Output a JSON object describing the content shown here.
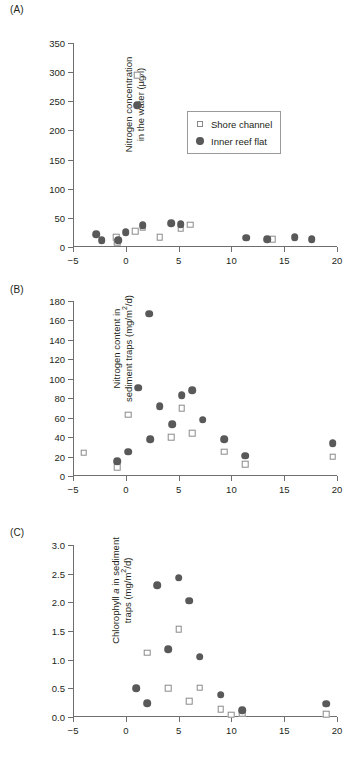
{
  "figure": {
    "panels": [
      {
        "id": "a",
        "label": "(A)",
        "ytitle_line1": "Nitrogen concentration",
        "ytitle_line2_pre": "in the water (µg/l)",
        "ytitle_line2_post": ""
      },
      {
        "id": "b",
        "label": "(B)",
        "ytitle_line1": "Nitrogen content in",
        "ytitle_line2_pre": "sediment traps (mg/m",
        "ytitle_line2_sup": "2",
        "ytitle_line2_post": "/d)"
      },
      {
        "id": "c",
        "label": "(C)",
        "ytitle_line1_pre": "Chlorophyll ",
        "ytitle_line1_em": "a",
        "ytitle_line1_post": " in sediment",
        "ytitle_line2_pre": "traps (mg/m",
        "ytitle_line2_sup": "2",
        "ytitle_line2_post": "/d)"
      }
    ],
    "legend": {
      "items": [
        {
          "label": "Shore channel",
          "marker": "open-square-icon",
          "color": "#8a8a8a"
        },
        {
          "label": "Inner reef flat",
          "marker": "filled-circle-icon",
          "color": "#595959"
        }
      ]
    },
    "colors": {
      "filled_marker": "#595959",
      "open_marker_edge": "#8a8a8a",
      "axis": "#6e6e6e",
      "text": "#231f20",
      "background": "#ffffff"
    }
  },
  "chart_data": [
    {
      "type": "scatter",
      "panel": "(A)",
      "title": "",
      "xlabel": "",
      "ylabel": "Nitrogen concentration in the water (µg/l)",
      "xlim": [
        -5,
        20
      ],
      "ylim": [
        0,
        350
      ],
      "xticks": [
        -5,
        0,
        5,
        10,
        15,
        20
      ],
      "yticks": [
        0,
        50,
        100,
        150,
        200,
        250,
        300,
        350
      ],
      "grid": false,
      "legend_position": "inside-upper-center",
      "series": [
        {
          "name": "Shore channel",
          "marker": "open square",
          "points": [
            [
              -0.9,
              17
            ],
            [
              -0.8,
              8
            ],
            [
              0.9,
              27
            ],
            [
              1.1,
              295
            ],
            [
              1.6,
              33
            ],
            [
              3.2,
              17
            ],
            [
              5.2,
              32
            ],
            [
              6.1,
              38
            ],
            [
              13.9,
              13
            ]
          ]
        },
        {
          "name": "Inner reef flat",
          "marker": "filled circle",
          "points": [
            [
              -2.8,
              22
            ],
            [
              -2.3,
              12
            ],
            [
              -0.7,
              12
            ],
            [
              0.0,
              25
            ],
            [
              1.1,
              243
            ],
            [
              1.6,
              37
            ],
            [
              4.3,
              41
            ],
            [
              5.2,
              39
            ],
            [
              11.4,
              16
            ],
            [
              13.4,
              13
            ],
            [
              16.0,
              17
            ],
            [
              17.6,
              13
            ]
          ]
        }
      ]
    },
    {
      "type": "scatter",
      "panel": "(B)",
      "title": "",
      "xlabel": "",
      "ylabel": "Nitrogen content in sediment traps (mg/m2/d)",
      "xlim": [
        -5,
        20
      ],
      "ylim": [
        0,
        180
      ],
      "xticks": [
        -5,
        0,
        5,
        10,
        15,
        20
      ],
      "yticks": [
        0,
        20,
        40,
        60,
        80,
        100,
        120,
        140,
        160,
        180
      ],
      "grid": false,
      "legend_position": "none",
      "series": [
        {
          "name": "Shore channel",
          "marker": "open square",
          "points": [
            [
              -4.0,
              24
            ],
            [
              -0.8,
              9
            ],
            [
              0.2,
              63
            ],
            [
              4.3,
              40
            ],
            [
              5.3,
              70
            ],
            [
              6.3,
              44
            ],
            [
              9.3,
              25
            ],
            [
              11.3,
              12
            ],
            [
              19.6,
              20
            ]
          ]
        },
        {
          "name": "Inner reef flat",
          "marker": "filled circle",
          "points": [
            [
              -0.8,
              15
            ],
            [
              0.2,
              25
            ],
            [
              1.2,
              91
            ],
            [
              2.2,
              167
            ],
            [
              2.3,
              38
            ],
            [
              3.2,
              72
            ],
            [
              4.4,
              53
            ],
            [
              5.3,
              83
            ],
            [
              6.3,
              88
            ],
            [
              7.3,
              58
            ],
            [
              9.3,
              38
            ],
            [
              11.3,
              21
            ],
            [
              19.6,
              34
            ]
          ]
        }
      ]
    },
    {
      "type": "scatter",
      "panel": "(C)",
      "title": "",
      "xlabel": "",
      "ylabel": "Chlorophyll a in sediment traps (mg/m2/d)",
      "xlim": [
        -5,
        20
      ],
      "ylim": [
        0.0,
        3.0
      ],
      "xticks": [
        -5,
        0,
        5,
        10,
        15,
        20
      ],
      "yticks": [
        0.0,
        0.5,
        1.0,
        1.5,
        2.0,
        2.5,
        3.0
      ],
      "grid": false,
      "legend_position": "none",
      "series": [
        {
          "name": "Shore channel",
          "marker": "open square",
          "points": [
            [
              2.0,
              1.12
            ],
            [
              4.0,
              0.5
            ],
            [
              5.0,
              1.53
            ],
            [
              6.0,
              0.28
            ],
            [
              7.0,
              0.51
            ],
            [
              9.0,
              0.14
            ],
            [
              10.0,
              0.04
            ],
            [
              11.0,
              0.06
            ],
            [
              19.0,
              0.05
            ]
          ]
        },
        {
          "name": "Inner reef flat",
          "marker": "filled circle",
          "points": [
            [
              1.0,
              0.5
            ],
            [
              2.0,
              0.24
            ],
            [
              3.0,
              2.3
            ],
            [
              4.0,
              1.18
            ],
            [
              5.0,
              2.43
            ],
            [
              6.0,
              2.03
            ],
            [
              7.0,
              1.05
            ],
            [
              9.0,
              0.39
            ],
            [
              11.0,
              0.12
            ],
            [
              19.0,
              0.23
            ]
          ]
        }
      ]
    }
  ]
}
